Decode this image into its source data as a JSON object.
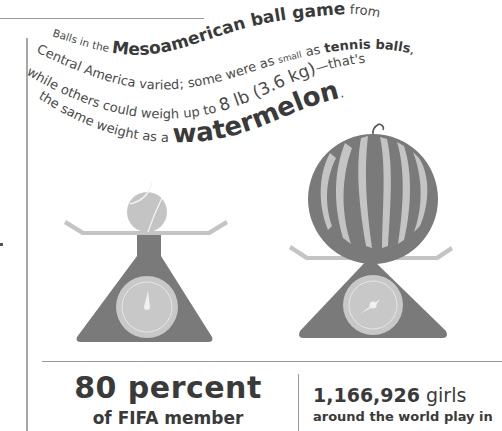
{
  "caption": {
    "line1": {
      "pre": "Balls in the ",
      "bold": "Mesoamerican ball game",
      "post": " from"
    },
    "line2": {
      "pre": "Central America varied; some were as ",
      "small": "small",
      "mid": " as ",
      "bold": "tennis balls",
      "post": ","
    },
    "line3": {
      "pre": "while others could weigh up to ",
      "big": "8 lb (3.6 kg)",
      "post": "—that's"
    },
    "line4": {
      "pre": "the same weight as a ",
      "bold": "watermelon",
      "post": "."
    }
  },
  "illustration": {
    "left_scale": {
      "object": "tennis ball",
      "label": "tennis-ball-on-scale"
    },
    "right_scale": {
      "object": "watermelon",
      "label": "watermelon-on-scale"
    },
    "colors": {
      "dark": "#7a7a7a",
      "light": "#c4c4c4",
      "dial": "#cfcfcf",
      "text": "#4a4a4a"
    }
  },
  "stats": {
    "left": {
      "big": "80 percent",
      "sub": "of FIFA member"
    },
    "right": {
      "number": "1,166,926",
      "unit": " girls",
      "sub": "around the world play in"
    }
  }
}
